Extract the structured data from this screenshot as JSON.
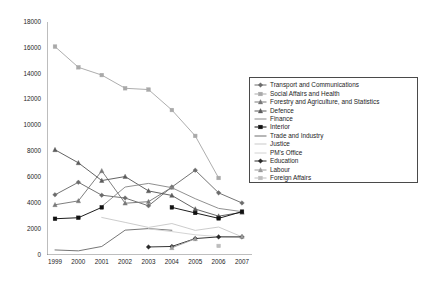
{
  "chart_data": {
    "type": "line",
    "title": "",
    "xlabel": "",
    "ylabel": "",
    "x": [
      1999,
      2000,
      2001,
      2002,
      2003,
      2004,
      2005,
      2006,
      2007
    ],
    "categories": [
      "1999",
      "2000",
      "2001",
      "2002",
      "2003",
      "2004",
      "2005",
      "2006",
      "2007"
    ],
    "ylim": [
      0,
      18000
    ],
    "ytick_step": 2000,
    "yticks": [
      "0",
      "2000",
      "4000",
      "6000",
      "8000",
      "10000",
      "12000",
      "14000",
      "16000",
      "18000"
    ],
    "grid": false,
    "legend_position": "right",
    "series": [
      {
        "name": "Transport and Communications",
        "color": "#6b6b6b",
        "marker": "diamond",
        "values": [
          4650,
          5620,
          4620,
          4400,
          3800,
          5250,
          6550,
          4800,
          4020
        ]
      },
      {
        "name": "Social Affairs and Health",
        "color": "#a9a9a9",
        "marker": "square",
        "values": [
          16100,
          14500,
          13900,
          12880,
          12780,
          11200,
          9200,
          5950,
          null
        ]
      },
      {
        "name": "Forestry and Agriculture, and Statistics",
        "color": "#787878",
        "marker": "triangle",
        "values": [
          3880,
          4180,
          6500,
          4000,
          4120,
          5230,
          null,
          null,
          null
        ]
      },
      {
        "name": "Defence",
        "color": "#5c5c5c",
        "marker": "triangle",
        "values": [
          8130,
          7120,
          5750,
          6060,
          4950,
          4600,
          3550,
          3000,
          3300
        ]
      },
      {
        "name": "Finance",
        "color": "#8a8a8a",
        "marker": "none",
        "values": [
          null,
          null,
          3750,
          5250,
          5530,
          5200,
          4350,
          3600,
          3350
        ]
      },
      {
        "name": "Interior",
        "color": "#111111",
        "marker": "square",
        "values": [
          2800,
          2880,
          3680,
          null,
          null,
          3680,
          3250,
          2830,
          3350
        ]
      },
      {
        "name": "Trade and Industry",
        "color": "#6f6f6f",
        "marker": "none",
        "values": [
          390,
          320,
          660,
          1920,
          2040,
          1910,
          null,
          null,
          null
        ]
      },
      {
        "name": "Justice",
        "color": "#c9c9c9",
        "marker": "none",
        "values": [
          null,
          null,
          2900,
          2520,
          2130,
          2430,
          1900,
          2160,
          1400
        ]
      },
      {
        "name": "PM's Office",
        "color": "#d2d2d2",
        "marker": "none",
        "values": [
          null,
          null,
          null,
          null,
          2020,
          1810,
          1560,
          1420,
          1380
        ]
      },
      {
        "name": "Education",
        "color": "#2a2a2a",
        "marker": "diamond",
        "values": [
          null,
          null,
          null,
          null,
          620,
          660,
          1270,
          1400,
          1400
        ]
      },
      {
        "name": "Labour",
        "color": "#9c9c9c",
        "marker": "triangle",
        "values": [
          null,
          null,
          null,
          null,
          null,
          560,
          1250,
          null,
          1430
        ]
      },
      {
        "name": "Foreign Affairs",
        "color": "#bdbdbd",
        "marker": "square",
        "values": [
          null,
          null,
          null,
          null,
          null,
          null,
          null,
          700,
          null
        ]
      }
    ]
  }
}
